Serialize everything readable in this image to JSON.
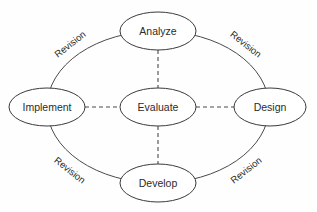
{
  "diagram": {
    "background_color": "#fefefe",
    "stroke_color": "#4a4a4a",
    "text_color": "#2b2b2b",
    "nodes": [
      {
        "id": "analyze",
        "label": "Analyze",
        "cx": 158,
        "cy": 31,
        "rx": 38,
        "ry": 19
      },
      {
        "id": "implement",
        "label": "Implement",
        "cx": 47,
        "cy": 107,
        "rx": 38,
        "ry": 19
      },
      {
        "id": "evaluate",
        "label": "Evaluate",
        "cx": 158,
        "cy": 107,
        "rx": 38,
        "ry": 19
      },
      {
        "id": "design",
        "label": "Design",
        "cx": 270,
        "cy": 107,
        "rx": 36,
        "ry": 19
      },
      {
        "id": "develop",
        "label": "Develop",
        "cx": 158,
        "cy": 183,
        "rx": 38,
        "ry": 19
      }
    ],
    "ring": {
      "cx": 158,
      "cy": 107,
      "rx": 111,
      "ry": 76
    },
    "dashed_links": [
      {
        "id": "evaluate-analyze",
        "from": "evaluate",
        "to": "analyze",
        "x1": 158,
        "y1": 50,
        "x2": 158,
        "y2": 88
      },
      {
        "id": "evaluate-develop",
        "from": "evaluate",
        "to": "develop",
        "x1": 158,
        "y1": 126,
        "x2": 158,
        "y2": 164
      },
      {
        "id": "evaluate-implement",
        "from": "evaluate",
        "to": "implement",
        "x1": 85,
        "y1": 107,
        "x2": 120,
        "y2": 107
      },
      {
        "id": "evaluate-design",
        "from": "evaluate",
        "to": "design",
        "x1": 196,
        "y1": 107,
        "x2": 234,
        "y2": 107
      }
    ],
    "revision_labels": [
      {
        "id": "revision-top-left",
        "label": "Revision",
        "x": 70,
        "y": 44,
        "rotation": -38
      },
      {
        "id": "revision-top-right",
        "label": "Revision",
        "x": 246,
        "y": 44,
        "rotation": 38
      },
      {
        "id": "revision-bottom-left",
        "label": "Revision",
        "x": 70,
        "y": 170,
        "rotation": 38
      },
      {
        "id": "revision-bottom-right",
        "label": "Revision",
        "x": 246,
        "y": 170,
        "rotation": -38
      }
    ]
  }
}
